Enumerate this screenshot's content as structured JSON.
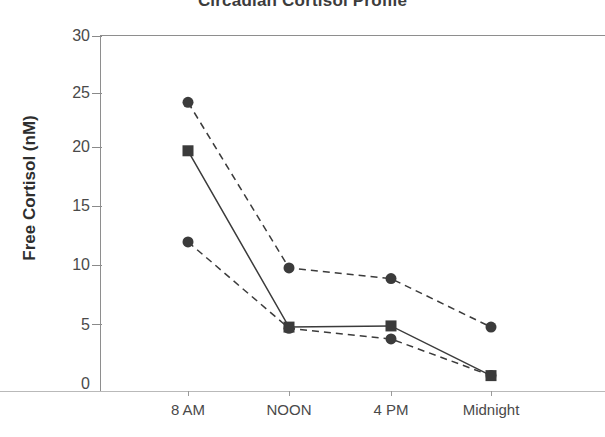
{
  "chart_data": {
    "type": "line",
    "title": "Circadian Cortisol Profile",
    "xlabel": "",
    "ylabel": "Free Cortisol (nM)",
    "categories": [
      "8 AM",
      "NOON",
      "4 PM",
      "Midnight"
    ],
    "ylim": [
      0,
      30
    ],
    "yticks": [
      0,
      5,
      10,
      15,
      20,
      25,
      30
    ],
    "ytick_labels": [
      "0",
      "5",
      "10",
      "15",
      "20",
      "25",
      "30"
    ],
    "grid": false,
    "legend": "none",
    "series": [
      {
        "name": "series-1",
        "marker": "circle",
        "linestyle": "dashed",
        "color": "#3b3b3b",
        "values": [
          24.4,
          10.4,
          9.5,
          5.4
        ]
      },
      {
        "name": "series-2",
        "marker": "square",
        "linestyle": "solid",
        "color": "#3b3b3b",
        "values": [
          20.3,
          5.4,
          5.5,
          1.3
        ]
      },
      {
        "name": "series-3",
        "marker": "circle",
        "linestyle": "dashed",
        "color": "#3b3b3b",
        "values": [
          12.6,
          5.3,
          4.4,
          1.3
        ]
      }
    ]
  },
  "axis": {
    "y_title": "Free Cortisol (nM)",
    "y_labels": [
      "30",
      "25",
      "20",
      "15",
      "10",
      "5",
      "0"
    ],
    "x_labels": [
      "8 AM",
      "NOON",
      "4 PM",
      "Midnight"
    ]
  },
  "title": {
    "text": "Circadian Cortisol Profile"
  }
}
